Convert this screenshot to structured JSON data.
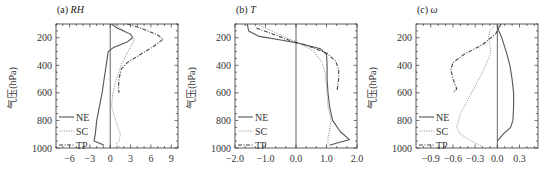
{
  "chart_data": [
    {
      "type": "line",
      "panel": "a",
      "title_prefix": "(a) ",
      "title_var": "RH",
      "ylabel": "气压(hPa)",
      "xlabel": "",
      "xlim": [
        -8,
        10
      ],
      "ylim": [
        1000,
        100
      ],
      "xticks": [
        -6,
        -3,
        0,
        3,
        6,
        9
      ],
      "yticks": [
        200,
        400,
        600,
        800,
        1000
      ],
      "legend": [
        "NE",
        "SC",
        "TP"
      ],
      "legend_position": "lower left",
      "series": [
        {
          "name": "NE",
          "style": "solid",
          "points": [
            [
              0.2,
              100
            ],
            [
              1,
              130
            ],
            [
              3,
              175
            ],
            [
              3.3,
              200
            ],
            [
              2.5,
              230
            ],
            [
              0.5,
              270
            ],
            [
              -0.3,
              300
            ],
            [
              -0.6,
              400
            ],
            [
              -0.9,
              500
            ],
            [
              -1.2,
              600
            ],
            [
              -1.6,
              700
            ],
            [
              -2,
              800
            ],
            [
              -2.2,
              900
            ],
            [
              -2.4,
              950
            ],
            [
              -1.3,
              970
            ],
            [
              -0.9,
              980
            ]
          ]
        },
        {
          "name": "SC",
          "style": "dotted",
          "points": [
            [
              0.5,
              100
            ],
            [
              1.5,
              130
            ],
            [
              3,
              180
            ],
            [
              3.6,
              210
            ],
            [
              3.2,
              250
            ],
            [
              2.6,
              300
            ],
            [
              1.6,
              400
            ],
            [
              0.9,
              500
            ],
            [
              0.4,
              600
            ],
            [
              0.2,
              700
            ],
            [
              0.8,
              800
            ],
            [
              1.5,
              900
            ],
            [
              1.3,
              950
            ],
            [
              0.9,
              970
            ],
            [
              1.6,
              1000
            ]
          ]
        },
        {
          "name": "TP",
          "style": "dashdot",
          "points": [
            [
              2.5,
              100
            ],
            [
              4.5,
              130
            ],
            [
              7,
              180
            ],
            [
              7.8,
              210
            ],
            [
              6.5,
              260
            ],
            [
              4.5,
              320
            ],
            [
              2.5,
              380
            ],
            [
              1.6,
              430
            ],
            [
              1.3,
              500
            ],
            [
              1.2,
              560
            ],
            [
              1.3,
              600
            ]
          ]
        }
      ]
    },
    {
      "type": "line",
      "panel": "b",
      "title_prefix": "(b) ",
      "title_var": "T",
      "ylabel": "气压(hPa)",
      "xlabel": "",
      "xlim": [
        -2.0,
        2.0
      ],
      "ylim": [
        1000,
        100
      ],
      "xticks": [
        "-2.0",
        "-1.0",
        "0.0",
        "1.0",
        "2.0"
      ],
      "yticks": [
        200,
        400,
        600,
        800,
        1000
      ],
      "legend": [
        "NE",
        "SC",
        "TP"
      ],
      "legend_position": "lower left",
      "series": [
        {
          "name": "NE",
          "style": "solid",
          "points": [
            [
              -1.6,
              100
            ],
            [
              -1.55,
              150
            ],
            [
              -1.2,
              190
            ],
            [
              -0.4,
              220
            ],
            [
              0.2,
              245
            ],
            [
              0.8,
              280
            ],
            [
              1.0,
              320
            ],
            [
              1.02,
              400
            ],
            [
              1.02,
              500
            ],
            [
              1.05,
              600
            ],
            [
              1.1,
              700
            ],
            [
              1.2,
              800
            ],
            [
              1.45,
              880
            ],
            [
              1.75,
              940
            ],
            [
              1.4,
              960
            ],
            [
              1.1,
              980
            ]
          ]
        },
        {
          "name": "SC",
          "style": "dotted",
          "points": [
            [
              -1.3,
              100
            ],
            [
              -0.8,
              150
            ],
            [
              -0.3,
              200
            ],
            [
              0.2,
              250
            ],
            [
              0.6,
              300
            ],
            [
              0.85,
              380
            ],
            [
              0.95,
              450
            ],
            [
              1.0,
              550
            ],
            [
              1.05,
              700
            ],
            [
              1.15,
              800
            ],
            [
              1.1,
              870
            ],
            [
              1.05,
              930
            ],
            [
              1.05,
              980
            ]
          ]
        },
        {
          "name": "TP",
          "style": "dashdot",
          "points": [
            [
              -1.3,
              130
            ],
            [
              -0.8,
              170
            ],
            [
              -0.2,
              220
            ],
            [
              0.4,
              260
            ],
            [
              1.0,
              310
            ],
            [
              1.3,
              370
            ],
            [
              1.4,
              430
            ],
            [
              1.4,
              500
            ],
            [
              1.35,
              580
            ]
          ]
        }
      ]
    },
    {
      "type": "line",
      "panel": "c",
      "title_prefix": "(c) ",
      "title_var": "ω",
      "ylabel": "气压(hPa)",
      "xlabel": "",
      "xlim": [
        -1.1,
        0.55
      ],
      "ylim": [
        1000,
        100
      ],
      "xticks": [
        "-0.9",
        "-0.6",
        "-0.3",
        "0.0",
        "0.3"
      ],
      "yticks": [
        200,
        400,
        600,
        800,
        1000
      ],
      "legend": [
        "NE",
        "SC",
        "TP"
      ],
      "legend_position": "lower left",
      "series": [
        {
          "name": "NE",
          "style": "solid",
          "points": [
            [
              0.0,
              100
            ],
            [
              0.02,
              150
            ],
            [
              0.06,
              200
            ],
            [
              0.12,
              300
            ],
            [
              0.17,
              400
            ],
            [
              0.2,
              500
            ],
            [
              0.22,
              600
            ],
            [
              0.22,
              700
            ],
            [
              0.21,
              800
            ],
            [
              0.18,
              850
            ],
            [
              0.08,
              900
            ],
            [
              0.0,
              950
            ]
          ]
        },
        {
          "name": "SC",
          "style": "dotted",
          "points": [
            [
              -0.02,
              100
            ],
            [
              -0.1,
              150
            ],
            [
              -0.12,
              200
            ],
            [
              -0.09,
              280
            ],
            [
              -0.1,
              330
            ],
            [
              -0.2,
              450
            ],
            [
              -0.3,
              550
            ],
            [
              -0.4,
              650
            ],
            [
              -0.5,
              750
            ],
            [
              -0.55,
              850
            ],
            [
              -0.5,
              900
            ],
            [
              -0.35,
              950
            ],
            [
              -0.2,
              990
            ]
          ]
        },
        {
          "name": "TP",
          "style": "dashdot",
          "points": [
            [
              0.05,
              100
            ],
            [
              -0.02,
              170
            ],
            [
              -0.2,
              250
            ],
            [
              -0.45,
              320
            ],
            [
              -0.6,
              380
            ],
            [
              -0.63,
              430
            ],
            [
              -0.6,
              500
            ],
            [
              -0.55,
              570
            ],
            [
              -0.6,
              600
            ]
          ]
        }
      ]
    }
  ],
  "panels": [
    {
      "title_prefix": "(a) ",
      "title_var": "RH"
    },
    {
      "title_prefix": "(b) ",
      "title_var": "T"
    },
    {
      "title_prefix": "(c) ",
      "title_var": "ω"
    }
  ],
  "ylabel": "气压(hPa)",
  "yticks": [
    "200",
    "400",
    "600",
    "800",
    "1000"
  ],
  "xticks_a": [
    "-6",
    "-3",
    "0",
    "3",
    "6",
    "9"
  ],
  "xticks_b": [
    "-2.0",
    "-1.0",
    "0.0",
    "1.0",
    "2.0"
  ],
  "xticks_c": [
    "-0.9",
    "-0.6",
    "-0.3",
    "0.0",
    "0.3"
  ],
  "legend": [
    "NE",
    "SC",
    "TP"
  ],
  "colors": {
    "NE": "#555555",
    "SC": "#999999",
    "TP": "#444444",
    "axis": "#333333"
  }
}
